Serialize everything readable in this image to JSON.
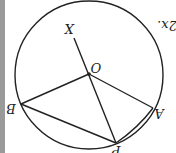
{
  "diagram": {
    "orientation": "rotated 180 degrees",
    "colors": {
      "stroke": "#222222",
      "background": "#ffffff",
      "edge_strip": "#9a9a9a"
    },
    "circle": {
      "cx": 89,
      "cy": 75,
      "r": 74
    },
    "points": {
      "O": {
        "label": "O",
        "x": 89,
        "y": 74
      },
      "X": {
        "label": "X",
        "x": 74,
        "y": 38
      },
      "A": {
        "label": "A",
        "x": 153,
        "y": 108
      },
      "B": {
        "label": "B",
        "x": 21,
        "y": 104
      },
      "P": {
        "label": "P",
        "x": 116,
        "y": 143
      }
    },
    "segments": [
      "OX",
      "OP",
      "OA",
      "OB",
      "BP",
      "AP"
    ],
    "side_text": "2x."
  }
}
